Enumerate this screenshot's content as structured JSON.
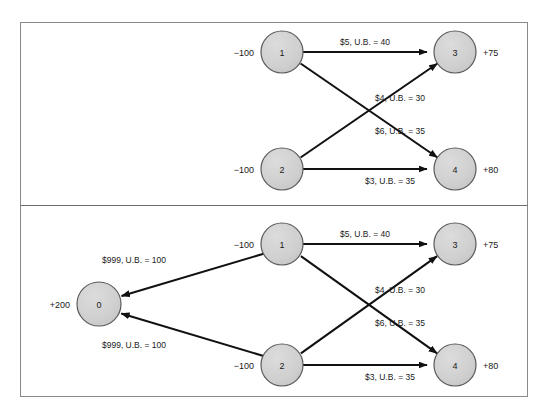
{
  "figure": {
    "frame": {
      "border_color": "#8a8a8a",
      "background_color": "#ffffff",
      "divider_color": "#6f6f6f"
    },
    "style": {
      "node_fill": "#cfcfcf",
      "node_stroke": "#5a5a5a",
      "arc_color": "#111111",
      "text_color": "#1a1a1a"
    },
    "panels": [
      {
        "id": "panel-top",
        "name": "uncapacitated-transportation-network",
        "nodes": [
          {
            "id": "n1",
            "label": "1",
            "supply": "−100",
            "supply_side": "left"
          },
          {
            "id": "n2",
            "label": "2",
            "supply": "−100",
            "supply_side": "left"
          },
          {
            "id": "n3",
            "label": "3",
            "supply": "+75",
            "supply_side": "right"
          },
          {
            "id": "n4",
            "label": "4",
            "supply": "+80",
            "supply_side": "right"
          }
        ],
        "arcs": [
          {
            "from": "n1",
            "to": "n3",
            "label": "$5, U.B. = 40",
            "cost": 5,
            "upper_bound": 40
          },
          {
            "from": "n2",
            "to": "n3",
            "label": "$4, U.B. = 30",
            "cost": 4,
            "upper_bound": 30
          },
          {
            "from": "n1",
            "to": "n4",
            "label": "$6, U.B. = 35",
            "cost": 6,
            "upper_bound": 35
          },
          {
            "from": "n2",
            "to": "n4",
            "label": "$3, U.B. = 35",
            "cost": 3,
            "upper_bound": 35
          }
        ]
      },
      {
        "id": "panel-bottom",
        "name": "balanced-network-with-dummy-node",
        "nodes": [
          {
            "id": "n0",
            "label": "0",
            "supply": "+200",
            "supply_side": "left"
          },
          {
            "id": "n1",
            "label": "1",
            "supply": "−100",
            "supply_side": "left"
          },
          {
            "id": "n2",
            "label": "2",
            "supply": "−100",
            "supply_side": "left"
          },
          {
            "id": "n3",
            "label": "3",
            "supply": "+75",
            "supply_side": "right"
          },
          {
            "id": "n4",
            "label": "4",
            "supply": "+80",
            "supply_side": "right"
          }
        ],
        "arcs": [
          {
            "from": "n1",
            "to": "n0",
            "label": "$999, U.B. = 100",
            "cost": 999,
            "upper_bound": 100
          },
          {
            "from": "n2",
            "to": "n0",
            "label": "$999, U.B. = 100",
            "cost": 999,
            "upper_bound": 100
          },
          {
            "from": "n1",
            "to": "n3",
            "label": "$5, U.B. = 40",
            "cost": 5,
            "upper_bound": 40
          },
          {
            "from": "n2",
            "to": "n3",
            "label": "$4, U.B. = 30",
            "cost": 4,
            "upper_bound": 30
          },
          {
            "from": "n1",
            "to": "n4",
            "label": "$6, U.B. = 35",
            "cost": 6,
            "upper_bound": 35
          },
          {
            "from": "n2",
            "to": "n4",
            "label": "$3, U.B. = 35",
            "cost": 3,
            "upper_bound": 35
          }
        ]
      }
    ],
    "labels": {
      "top": {
        "n1_id": "1",
        "n2_id": "2",
        "n3_id": "3",
        "n4_id": "4",
        "n1_supply": "−100",
        "n2_supply": "−100",
        "n3_supply": "+75",
        "n4_supply": "+80",
        "a13": "$5, U.B. = 40",
        "a23": "$4, U.B. = 30",
        "a14": "$6, U.B. = 35",
        "a24": "$3, U.B. = 35"
      },
      "bottom": {
        "n0_id": "0",
        "n1_id": "1",
        "n2_id": "2",
        "n3_id": "3",
        "n4_id": "4",
        "n0_supply": "+200",
        "n1_supply": "−100",
        "n2_supply": "−100",
        "n3_supply": "+75",
        "n4_supply": "+80",
        "a10": "$999, U.B. = 100",
        "a20": "$999, U.B. = 100",
        "a13": "$5, U.B. = 40",
        "a23": "$4, U.B. = 30",
        "a14": "$6, U.B. = 35",
        "a24": "$3, U.B. = 35"
      }
    }
  }
}
